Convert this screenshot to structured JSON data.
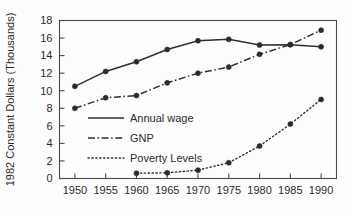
{
  "chart_data": {
    "type": "line",
    "title": "",
    "xlabel": "",
    "ylabel": "1982 Constant Dollars (Thousands)",
    "x": [
      1950,
      1955,
      1960,
      1965,
      1970,
      1975,
      1980,
      1985,
      1990
    ],
    "xticklabels": [
      "1950",
      "1955",
      "1960",
      "1965",
      "1970",
      "1975",
      "1980",
      "1985",
      "1990"
    ],
    "yticks": [
      0,
      2,
      4,
      6,
      8,
      10,
      12,
      14,
      16,
      18
    ],
    "yticklabels": [
      "0",
      "2",
      "4",
      "6",
      "8",
      "10",
      "12",
      "14",
      "16",
      "18"
    ],
    "xlim": [
      1947.5,
      1992.5
    ],
    "ylim": [
      0,
      18
    ],
    "grid": false,
    "legend_position": "inside-lower-left",
    "series": [
      {
        "name": "Annual wage",
        "style": "solid",
        "color": "#2e2e2e",
        "x": [
          1950,
          1955,
          1960,
          1965,
          1970,
          1975,
          1980,
          1985,
          1990
        ],
        "values": [
          10.5,
          12.2,
          13.3,
          14.7,
          15.7,
          15.85,
          15.2,
          15.25,
          15.0
        ]
      },
      {
        "name": "GNP",
        "style": "dashdot",
        "color": "#2e2e2e",
        "x": [
          1950,
          1955,
          1960,
          1965,
          1970,
          1975,
          1980,
          1985,
          1990
        ],
        "values": [
          8.0,
          9.2,
          9.45,
          10.9,
          12.0,
          12.7,
          14.15,
          15.25,
          16.9
        ]
      },
      {
        "name": "Poverty Levels",
        "style": "dotted",
        "color": "#2e2e2e",
        "x": [
          1960,
          1965,
          1970,
          1975,
          1980,
          1985,
          1990
        ],
        "values": [
          0.6,
          0.65,
          0.95,
          1.8,
          3.7,
          6.2,
          9.0
        ]
      }
    ]
  },
  "legend": {
    "items": [
      {
        "label": "Annual wage",
        "style": "solid"
      },
      {
        "label": "GNP",
        "style": "dashdot"
      },
      {
        "label": "Poverty Levels",
        "style": "dotted"
      }
    ]
  }
}
